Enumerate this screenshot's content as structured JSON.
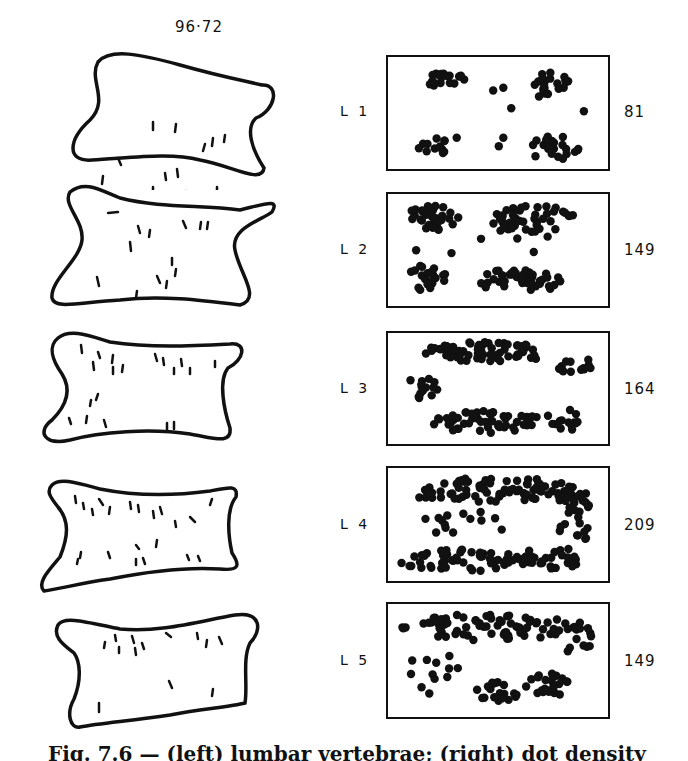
{
  "figure": {
    "specimen_label": "96·72",
    "caption": "Fig. 7.6 — (left) lumbar vertebrae; (right) dot density maps",
    "rows": [
      {
        "level": "L 1",
        "count": "81"
      },
      {
        "level": "L 2",
        "count": "149"
      },
      {
        "level": "L 3",
        "count": "164"
      },
      {
        "level": "L 4",
        "count": "209"
      },
      {
        "level": "L 5",
        "count": "149"
      }
    ]
  },
  "chart_data": {
    "type": "table",
    "title": "96·72",
    "columns": [
      "Vertebra",
      "Count"
    ],
    "categories": [
      "L1",
      "L2",
      "L3",
      "L4",
      "L5"
    ],
    "values": [
      81,
      149,
      164,
      209,
      149
    ]
  }
}
